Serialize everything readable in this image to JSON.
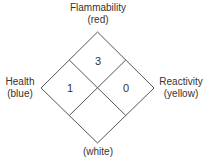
{
  "diagram": {
    "type": "NFPA 704 hazard diamond",
    "top": {
      "name": "Flammability",
      "color_label": "(red)",
      "value": "3"
    },
    "left": {
      "name": "Health",
      "color_label": "(blue)",
      "value": "1"
    },
    "right": {
      "name": "Reactivity",
      "color_label": "(yellow)",
      "value": "0"
    },
    "bottom": {
      "name": "",
      "color_label": "(white)",
      "value": ""
    }
  }
}
